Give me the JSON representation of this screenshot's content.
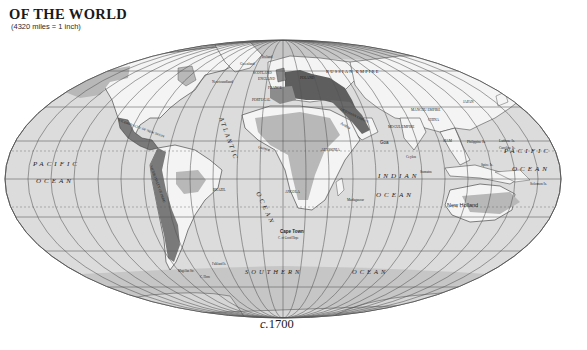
{
  "header": {
    "title": "OF THE WORLD",
    "scale": "(4320 miles = 1 inch)"
  },
  "caption": {
    "prefix": "c.",
    "year": "1700"
  },
  "colors": {
    "ocean": "#dcdcdc",
    "land_unclaimed": "#f4f4f4",
    "land_shaded": "#b8b8b8",
    "empire_dark": "#6e6e6e",
    "ice": "#c4c4c4",
    "grid": "#555555"
  },
  "oceans": {
    "pacific_west_1": "PACIFIC",
    "pacific_west_2": "OCEAN",
    "atlantic": "ATLANTIC",
    "atlantic_ocean": "OCEAN",
    "indian_1": "INDIAN",
    "indian_2": "OCEAN",
    "pacific_east_1": "PACIFIC",
    "pacific_east_2": "OCEAN",
    "southern": "SOUTHERN",
    "southern_ocean": "OCEAN"
  },
  "places": {
    "russian_empire": "RUSSIAN EMPIRE",
    "scotland": "SCOTLAND",
    "england": "ENGLAND",
    "france": "FRANCE",
    "poland": "POLAND",
    "portugal": "PORTUGAL",
    "spain": "SPAIN",
    "iceland": "Iceland",
    "greenland": "Greenland",
    "newfoundland": "Newfoundland",
    "baffin": "Baffin Bay",
    "ottoman": "OTTOMAN EMPIRE",
    "persia": "PERSIA",
    "arabia": "Arabia",
    "manchu": "MANCHU EMPIRE",
    "china": "CHINA",
    "japan": "JAPAN",
    "mogul": "MOGUL EMPIRE",
    "goa": "Goa",
    "ceylon": "Ceylon",
    "siam": "SIAM",
    "philippine": "Philippine Is.",
    "ladrone": "Ladrone Is.",
    "caroline": "Caroline Is.",
    "spice": "Spice Is.",
    "solomon": "Solomon Is.",
    "sumatra": "Sumatra",
    "new_holland": "New Holland",
    "new_spain": "VICEROYALTY OF NEW SPAIN",
    "peru": "VICEROYALTY OF PERU",
    "florida": "Florida",
    "cuba": "Cuba",
    "guinea": "Guinea",
    "abyssinia": "ABYSSINIA",
    "angola": "ANGOLA",
    "brazil": "BRAZIL",
    "guiana": "GUIANA",
    "madagascar": "Madagascar",
    "cape_town": "Cape Town",
    "cape_good_hope": "C. of Good Hope",
    "magellan": "Magellan Str.",
    "cape_horn": "C. Horn",
    "falkland": "Falkland Is.",
    "kalmucks": "KALMUCKS",
    "tibet": "TIBET",
    "siberia": "SIBERIA"
  }
}
